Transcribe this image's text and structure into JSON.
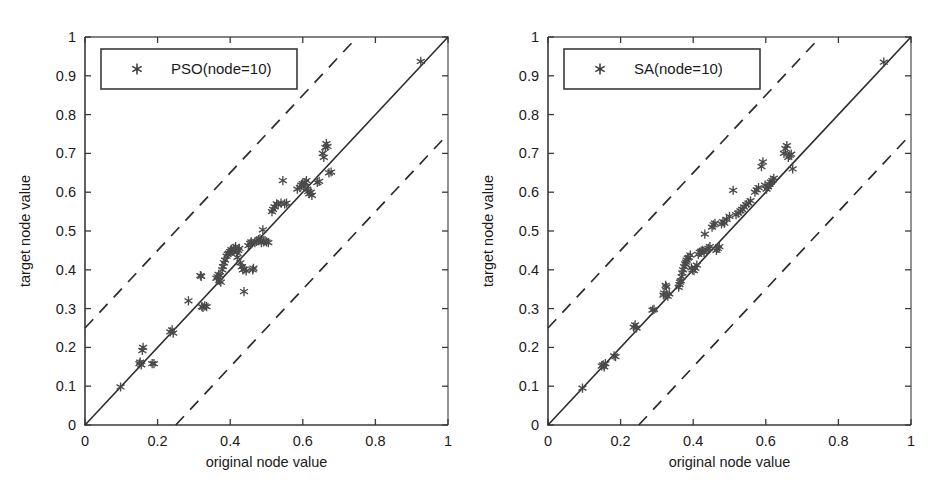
{
  "figure": {
    "background": "#ffffff",
    "width": 943,
    "height": 480,
    "panel_count": 2
  },
  "colors": {
    "axis": "#3a3a3a",
    "marker": "#4a4a4a",
    "diagonal": "#2b2b2b",
    "band": "#2b2b2b",
    "legend_border": "#3a3a3a",
    "background": "#ffffff"
  },
  "chart_data": [
    {
      "type": "scatter",
      "panel": "left",
      "title": "",
      "xlabel": "original node value",
      "ylabel": "target node value",
      "xlim": [
        0,
        1
      ],
      "ylim": [
        0,
        1
      ],
      "xticks": [
        0,
        0.2,
        0.4,
        0.6,
        0.8,
        1
      ],
      "xticklabels": [
        "0",
        "0.2",
        "0.4",
        "0.6",
        "0.8",
        "1"
      ],
      "yticks": [
        0,
        0.1,
        0.2,
        0.3,
        0.4,
        0.5,
        0.6,
        0.7,
        0.8,
        0.9,
        1
      ],
      "yticklabels": [
        "0",
        "0.1",
        "0.2",
        "0.3",
        "0.4",
        "0.5",
        "0.6",
        "0.7",
        "0.8",
        "0.9",
        "1"
      ],
      "grid": false,
      "legend_position": "upper left",
      "legend": [
        {
          "label": "PSO(node=10)",
          "marker": "asterisk"
        }
      ],
      "reference_lines": [
        {
          "name": "identity",
          "style": "solid",
          "slope": 1,
          "intercept": 0
        },
        {
          "name": "upper-band",
          "style": "dashed",
          "slope": 1,
          "intercept": 0.25
        },
        {
          "name": "lower-band",
          "style": "dashed",
          "slope": 1,
          "intercept": -0.25
        }
      ],
      "marker_style": "asterisk",
      "points": [
        [
          0.098,
          0.098
        ],
        [
          0.15,
          0.158
        ],
        [
          0.152,
          0.162
        ],
        [
          0.155,
          0.155
        ],
        [
          0.158,
          0.192
        ],
        [
          0.16,
          0.2
        ],
        [
          0.185,
          0.158
        ],
        [
          0.19,
          0.158
        ],
        [
          0.235,
          0.24
        ],
        [
          0.24,
          0.245
        ],
        [
          0.243,
          0.237
        ],
        [
          0.285,
          0.32
        ],
        [
          0.318,
          0.385
        ],
        [
          0.32,
          0.383
        ],
        [
          0.322,
          0.305
        ],
        [
          0.325,
          0.303
        ],
        [
          0.33,
          0.307
        ],
        [
          0.335,
          0.305
        ],
        [
          0.362,
          0.378
        ],
        [
          0.365,
          0.382
        ],
        [
          0.368,
          0.388
        ],
        [
          0.37,
          0.372
        ],
        [
          0.372,
          0.385
        ],
        [
          0.374,
          0.368
        ],
        [
          0.378,
          0.4
        ],
        [
          0.38,
          0.408
        ],
        [
          0.383,
          0.418
        ],
        [
          0.386,
          0.425
        ],
        [
          0.39,
          0.435
        ],
        [
          0.393,
          0.44
        ],
        [
          0.396,
          0.443
        ],
        [
          0.4,
          0.447
        ],
        [
          0.403,
          0.452
        ],
        [
          0.406,
          0.448
        ],
        [
          0.41,
          0.455
        ],
        [
          0.412,
          0.452
        ],
        [
          0.415,
          0.46
        ],
        [
          0.418,
          0.445
        ],
        [
          0.42,
          0.432
        ],
        [
          0.422,
          0.45
        ],
        [
          0.425,
          0.455
        ],
        [
          0.428,
          0.418
        ],
        [
          0.432,
          0.408
        ],
        [
          0.435,
          0.4
        ],
        [
          0.438,
          0.344
        ],
        [
          0.44,
          0.402
        ],
        [
          0.444,
          0.397
        ],
        [
          0.45,
          0.462
        ],
        [
          0.455,
          0.468
        ],
        [
          0.458,
          0.472
        ],
        [
          0.462,
          0.4
        ],
        [
          0.464,
          0.404
        ],
        [
          0.468,
          0.47
        ],
        [
          0.472,
          0.473
        ],
        [
          0.478,
          0.478
        ],
        [
          0.482,
          0.48
        ],
        [
          0.486,
          0.47
        ],
        [
          0.49,
          0.503
        ],
        [
          0.492,
          0.472
        ],
        [
          0.496,
          0.475
        ],
        [
          0.5,
          0.472
        ],
        [
          0.505,
          0.47
        ],
        [
          0.515,
          0.55
        ],
        [
          0.518,
          0.556
        ],
        [
          0.522,
          0.562
        ],
        [
          0.528,
          0.57
        ],
        [
          0.532,
          0.568
        ],
        [
          0.54,
          0.572
        ],
        [
          0.545,
          0.63
        ],
        [
          0.55,
          0.57
        ],
        [
          0.555,
          0.572
        ],
        [
          0.585,
          0.608
        ],
        [
          0.592,
          0.612
        ],
        [
          0.596,
          0.618
        ],
        [
          0.6,
          0.622
        ],
        [
          0.603,
          0.616
        ],
        [
          0.606,
          0.625
        ],
        [
          0.61,
          0.63
        ],
        [
          0.612,
          0.608
        ],
        [
          0.615,
          0.602
        ],
        [
          0.618,
          0.596
        ],
        [
          0.622,
          0.6
        ],
        [
          0.625,
          0.592
        ],
        [
          0.64,
          0.625
        ],
        [
          0.645,
          0.628
        ],
        [
          0.655,
          0.7
        ],
        [
          0.658,
          0.69
        ],
        [
          0.662,
          0.715
        ],
        [
          0.665,
          0.725
        ],
        [
          0.668,
          0.718
        ],
        [
          0.672,
          0.65
        ],
        [
          0.678,
          0.652
        ],
        [
          0.925,
          0.937
        ]
      ]
    },
    {
      "type": "scatter",
      "panel": "right",
      "title": "",
      "xlabel": "original node value",
      "ylabel": "target node value",
      "xlim": [
        0,
        1
      ],
      "ylim": [
        0,
        1
      ],
      "xticks": [
        0,
        0.2,
        0.4,
        0.6,
        0.8,
        1
      ],
      "xticklabels": [
        "0",
        "0.2",
        "0.4",
        "0.6",
        "0.8",
        "1"
      ],
      "yticks": [
        0,
        0.1,
        0.2,
        0.3,
        0.4,
        0.5,
        0.6,
        0.7,
        0.8,
        0.9,
        1
      ],
      "yticklabels": [
        "0",
        "0.1",
        "0.2",
        "0.3",
        "0.4",
        "0.5",
        "0.6",
        "0.7",
        "0.8",
        "0.9",
        "1"
      ],
      "grid": false,
      "legend_position": "upper left",
      "legend": [
        {
          "label": "SA(node=10)",
          "marker": "asterisk"
        }
      ],
      "reference_lines": [
        {
          "name": "identity",
          "style": "solid",
          "slope": 1,
          "intercept": 0
        },
        {
          "name": "upper-band",
          "style": "dashed",
          "slope": 1,
          "intercept": 0.25
        },
        {
          "name": "lower-band",
          "style": "dashed",
          "slope": 1,
          "intercept": -0.25
        }
      ],
      "marker_style": "asterisk",
      "points": [
        [
          0.095,
          0.095
        ],
        [
          0.148,
          0.152
        ],
        [
          0.152,
          0.155
        ],
        [
          0.155,
          0.15
        ],
        [
          0.158,
          0.158
        ],
        [
          0.182,
          0.178
        ],
        [
          0.186,
          0.176
        ],
        [
          0.236,
          0.252
        ],
        [
          0.24,
          0.258
        ],
        [
          0.244,
          0.25
        ],
        [
          0.288,
          0.296
        ],
        [
          0.292,
          0.298
        ],
        [
          0.318,
          0.335
        ],
        [
          0.32,
          0.34
        ],
        [
          0.324,
          0.36
        ],
        [
          0.326,
          0.356
        ],
        [
          0.33,
          0.332
        ],
        [
          0.334,
          0.338
        ],
        [
          0.36,
          0.355
        ],
        [
          0.362,
          0.362
        ],
        [
          0.364,
          0.368
        ],
        [
          0.366,
          0.372
        ],
        [
          0.368,
          0.382
        ],
        [
          0.37,
          0.392
        ],
        [
          0.372,
          0.4
        ],
        [
          0.375,
          0.408
        ],
        [
          0.378,
          0.415
        ],
        [
          0.38,
          0.42
        ],
        [
          0.382,
          0.425
        ],
        [
          0.385,
          0.43
        ],
        [
          0.388,
          0.432
        ],
        [
          0.392,
          0.438
        ],
        [
          0.395,
          0.405
        ],
        [
          0.398,
          0.4
        ],
        [
          0.402,
          0.398
        ],
        [
          0.406,
          0.404
        ],
        [
          0.41,
          0.412
        ],
        [
          0.414,
          0.44
        ],
        [
          0.418,
          0.445
        ],
        [
          0.422,
          0.448
        ],
        [
          0.426,
          0.45
        ],
        [
          0.43,
          0.445
        ],
        [
          0.432,
          0.492
        ],
        [
          0.438,
          0.452
        ],
        [
          0.442,
          0.455
        ],
        [
          0.446,
          0.46
        ],
        [
          0.452,
          0.51
        ],
        [
          0.456,
          0.516
        ],
        [
          0.46,
          0.52
        ],
        [
          0.464,
          0.45
        ],
        [
          0.468,
          0.455
        ],
        [
          0.472,
          0.46
        ],
        [
          0.478,
          0.518
        ],
        [
          0.482,
          0.524
        ],
        [
          0.486,
          0.52
        ],
        [
          0.492,
          0.53
        ],
        [
          0.5,
          0.538
        ],
        [
          0.51,
          0.605
        ],
        [
          0.518,
          0.542
        ],
        [
          0.524,
          0.546
        ],
        [
          0.53,
          0.552
        ],
        [
          0.535,
          0.556
        ],
        [
          0.54,
          0.562
        ],
        [
          0.546,
          0.568
        ],
        [
          0.552,
          0.572
        ],
        [
          0.558,
          0.578
        ],
        [
          0.57,
          0.6
        ],
        [
          0.575,
          0.606
        ],
        [
          0.58,
          0.612
        ],
        [
          0.588,
          0.666
        ],
        [
          0.592,
          0.678
        ],
        [
          0.598,
          0.618
        ],
        [
          0.602,
          0.608
        ],
        [
          0.606,
          0.614
        ],
        [
          0.61,
          0.62
        ],
        [
          0.614,
          0.626
        ],
        [
          0.618,
          0.63
        ],
        [
          0.622,
          0.636
        ],
        [
          0.65,
          0.7
        ],
        [
          0.654,
          0.712
        ],
        [
          0.658,
          0.72
        ],
        [
          0.662,
          0.69
        ],
        [
          0.666,
          0.695
        ],
        [
          0.67,
          0.698
        ],
        [
          0.674,
          0.66
        ],
        [
          0.925,
          0.935
        ]
      ]
    }
  ]
}
